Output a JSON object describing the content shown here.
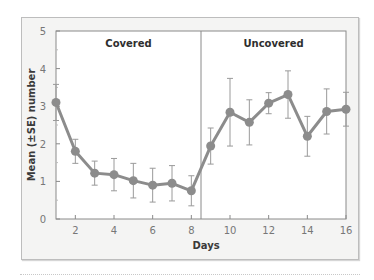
{
  "chart_data": {
    "type": "line",
    "title": "",
    "xlabel": "Days",
    "ylabel": "Mean (±SE) number",
    "xlim": [
      1,
      16
    ],
    "ylim": [
      0,
      5
    ],
    "xticks": [
      2,
      4,
      6,
      8,
      10,
      12,
      14,
      16
    ],
    "yticks": [
      0,
      1,
      2,
      3,
      4,
      5
    ],
    "grid": false,
    "divider_x": 8.5,
    "panels": [
      {
        "label": "Covered",
        "x_center": 4.75
      },
      {
        "label": "Uncovered",
        "x_center": 12.25
      }
    ],
    "series": [
      {
        "name": "Mean number",
        "color": "#8c8c8c",
        "x": [
          1,
          2,
          3,
          4,
          5,
          6,
          7,
          8,
          9,
          10,
          11,
          12,
          13,
          14,
          15,
          16
        ],
        "values": [
          3.1,
          1.8,
          1.22,
          1.18,
          1.02,
          0.9,
          0.95,
          0.75,
          1.94,
          2.84,
          2.57,
          3.08,
          3.31,
          2.2,
          2.86,
          2.92
        ],
        "se": [
          0.48,
          0.32,
          0.32,
          0.43,
          0.46,
          0.45,
          0.47,
          0.4,
          0.48,
          0.9,
          0.6,
          0.28,
          0.63,
          0.53,
          0.6,
          0.45
        ]
      }
    ]
  }
}
